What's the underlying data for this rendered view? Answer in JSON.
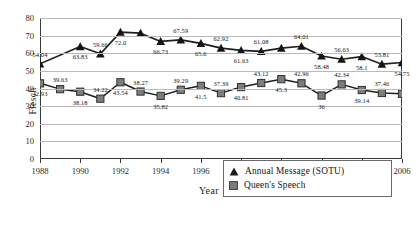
{
  "chart_data": {
    "type": "line",
    "title": "",
    "xlabel": "Year",
    "ylabel": "Flesch",
    "xlim": [
      1988,
      2006
    ],
    "ylim": [
      0,
      80
    ],
    "ytick_values": [
      0,
      10,
      20,
      30,
      40,
      50,
      60,
      70,
      80
    ],
    "ytick_labels": [
      "0",
      "10",
      "20",
      "30",
      "40",
      "50",
      "60",
      "70",
      "80"
    ],
    "xtick_values": [
      1988,
      1990,
      1992,
      1994,
      1996,
      1998,
      2000,
      2002,
      2004,
      2006
    ],
    "xtick_labels": [
      "1988",
      "1990",
      "1992",
      "1994",
      "1996",
      "1998",
      "2000",
      "2002",
      "2004",
      "2006"
    ],
    "grid": "horizontal",
    "legend_position": "lower-right",
    "x": [
      1988,
      1989,
      1990,
      1991,
      1992,
      1993,
      1994,
      1995,
      1996,
      1997,
      1998,
      1999,
      2000,
      2001,
      2002,
      2003,
      2004,
      2005,
      2006
    ],
    "series": [
      {
        "name": "Annual Message (SOTU)",
        "marker": "triangle",
        "color": "#1b1b1b",
        "x": [
          1988,
          1990,
          1991,
          1992,
          1993,
          1994,
          1995,
          1996,
          1997,
          1998,
          1999,
          2000,
          2001,
          2002,
          2003,
          2004,
          2005,
          2006
        ],
        "values": [
          54.04,
          63.83,
          59.66,
          72.0,
          71.4,
          66.73,
          67.59,
          65.6,
          62.92,
          61.63,
          61.08,
          62.9,
          64.01,
          58.48,
          56.63,
          58.1,
          53.81,
          54.75
        ],
        "labels": [
          "54.04",
          "63.83",
          "59.66",
          "72.0",
          "",
          "66.73",
          "67.59",
          "65.6",
          "62.92",
          "61.63",
          "61.08",
          "",
          "64.01",
          "58.48",
          "56.63",
          "58.1",
          "53.81",
          "54.75"
        ]
      },
      {
        "name": "Queen's Speech",
        "marker": "square",
        "color": "#5a5a5a",
        "x": [
          1988,
          1989,
          1990,
          1991,
          1992,
          1993,
          1994,
          1995,
          1996,
          1997,
          1998,
          1999,
          2000,
          2001,
          2002,
          2003,
          2004,
          2005,
          2006
        ],
        "values": [
          42.93,
          39.63,
          38.18,
          34.22,
          43.54,
          38.27,
          35.82,
          39.29,
          41.5,
          37.39,
          40.81,
          43.12,
          45.3,
          42.96,
          36.0,
          42.34,
          39.14,
          37.46,
          37.0
        ],
        "labels": [
          "42.93",
          "39.63",
          "38.18",
          "34.22",
          "43.54",
          "38.27",
          "35.82",
          "39.29",
          "41.5",
          "37.39",
          "40.81",
          "43.12",
          "45.3",
          "42.96",
          "36",
          "42.34",
          "39.14",
          "37.46",
          ""
        ]
      }
    ]
  },
  "legend": {
    "entries": [
      {
        "label": "Annual Message (SOTU)",
        "marker": "triangle-marker-icon"
      },
      {
        "label": "Queen's Speech",
        "marker": "square-marker-icon"
      }
    ]
  },
  "colors": {
    "sotu": "#1b1b1b",
    "queens": "#5a5a5a",
    "grid": "#b9b9b9",
    "axis": "#3a3a3a",
    "background": "#ffffff"
  }
}
